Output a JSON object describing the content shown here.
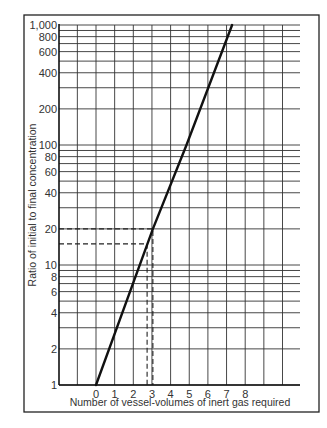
{
  "chart_data": {
    "type": "line",
    "title": "",
    "xlabel": "Number of vessel-volumes of inert gas required",
    "ylabel": "Ratio of initial to final concentration",
    "yscale": "log",
    "xlim": [
      -2,
      11
    ],
    "ylim": [
      1,
      1000
    ],
    "grid": true,
    "x_ticks": [
      0,
      1,
      2,
      3,
      4,
      5,
      6,
      7,
      8
    ],
    "x_tick_labels": [
      "0",
      "1",
      "2",
      "3",
      "4",
      "5",
      "6",
      "7",
      "8"
    ],
    "x_gridlines": [
      -2,
      -1,
      0,
      1,
      2,
      3,
      4,
      5,
      6,
      7,
      8,
      9,
      10
    ],
    "y_ticks": [
      1,
      2,
      4,
      6,
      8,
      10,
      20,
      40,
      60,
      80,
      100,
      200,
      400,
      600,
      800,
      1000
    ],
    "y_tick_labels": [
      "1",
      "2",
      "4",
      "6",
      "8",
      "10",
      "20",
      "40",
      "60",
      "80",
      "100",
      "200",
      "400",
      "600",
      "800",
      "1,000"
    ],
    "y_gridlines": [
      1,
      2,
      3,
      4,
      5,
      6,
      7,
      8,
      9,
      10,
      20,
      30,
      40,
      50,
      60,
      70,
      80,
      90,
      100,
      200,
      300,
      400,
      500,
      600,
      700,
      800,
      900,
      1000
    ],
    "series": [
      {
        "name": "Ratio vs vessel-volumes",
        "style": "solid",
        "points": [
          [
            0,
            1
          ],
          [
            3.05,
            20
          ],
          [
            4.85,
            100
          ],
          [
            7.3,
            1000
          ]
        ]
      }
    ],
    "annotations": [
      {
        "type": "dashed-guide",
        "y": 20,
        "x": 3.05
      },
      {
        "type": "dashed-guide",
        "y": 15,
        "x": 2.74
      }
    ]
  }
}
